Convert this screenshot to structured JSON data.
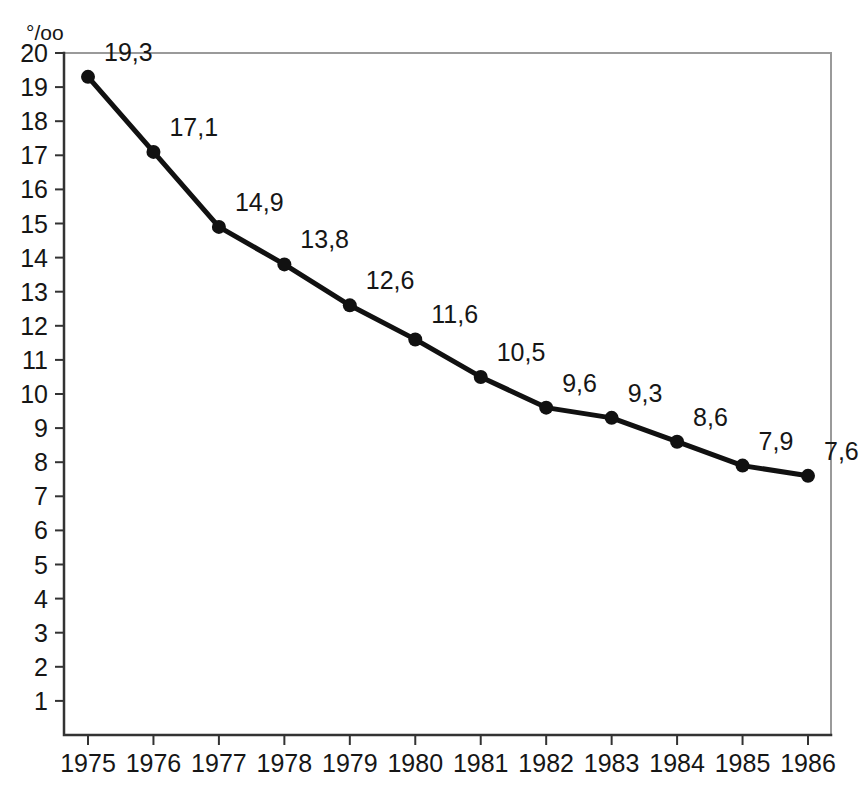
{
  "chart_data": {
    "type": "line",
    "title": "",
    "xlabel": "",
    "ylabel": "‰",
    "ylabel_glyph": "°/oo",
    "categories": [
      "1975",
      "1976",
      "1977",
      "1978",
      "1979",
      "1980",
      "1981",
      "1982",
      "1983",
      "1984",
      "1985",
      "1986"
    ],
    "values": [
      19.3,
      17.1,
      14.9,
      13.8,
      12.6,
      11.6,
      10.5,
      9.6,
      9.3,
      8.6,
      7.9,
      7.6
    ],
    "point_labels": [
      "19,3",
      "17,1",
      "14,9",
      "13,8",
      "12,6",
      "11,6",
      "10,5",
      "9,6",
      "9,3",
      "8,6",
      "7,9",
      "7,6"
    ],
    "ylim": [
      0,
      20
    ],
    "ytick_values": [
      20,
      19,
      18,
      17,
      16,
      15,
      14,
      13,
      12,
      11,
      10,
      9,
      8,
      7,
      6,
      5,
      4,
      3,
      2,
      1
    ],
    "ytick_labels": [
      "20",
      "19",
      "18",
      "17",
      "16",
      "15",
      "14",
      "13",
      "12",
      "11",
      "10",
      "9",
      "8",
      "7",
      "6",
      "5",
      "4",
      "3",
      "2",
      "1"
    ],
    "grid": false,
    "legend": null,
    "decimal_separator": ",",
    "series_color": "#111111",
    "frame_color": "#9a9a9a",
    "axis_color": "#333333",
    "background_color": "#ffffff"
  }
}
